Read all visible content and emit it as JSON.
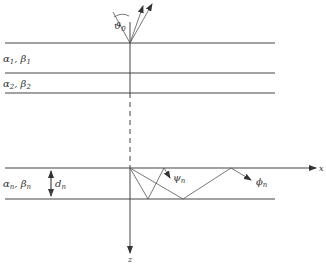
{
  "diagram": {
    "type": "layered-medium-wave-reflection",
    "layers": [
      {
        "id": "layer-1",
        "alpha": "α",
        "alpha_sub": "1",
        "beta": "β",
        "beta_sub": "1",
        "sep": ", "
      },
      {
        "id": "layer-2",
        "alpha": "α",
        "alpha_sub": "2",
        "beta": "β",
        "beta_sub": "2",
        "sep": ", "
      },
      {
        "id": "layer-n",
        "alpha": "α",
        "alpha_sub": "n",
        "beta": "β",
        "beta_sub": "n",
        "sep": ", "
      }
    ],
    "thickness_label": {
      "main": "d",
      "sub": "n"
    },
    "incidence_angle_label": {
      "main": "ϑ",
      "sub": "0"
    },
    "ray_labels": {
      "psi": {
        "main": "ψ",
        "sub": "n"
      },
      "phi": {
        "main": "ϕ",
        "sub": "n"
      }
    },
    "axes": {
      "x_label": "x",
      "z_label": "z"
    },
    "colors": {
      "line": "#444444",
      "background": "#ffffff"
    }
  }
}
